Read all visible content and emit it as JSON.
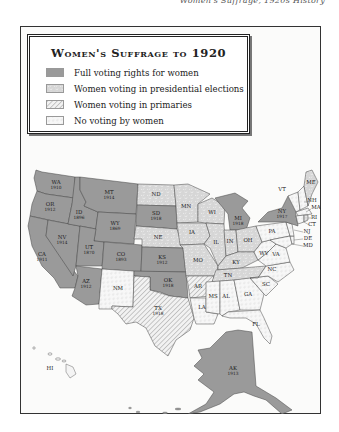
{
  "caption": "Women's Suffrage, 1920s History",
  "legend": {
    "title": "Women's Suffrage to 1920",
    "items": [
      {
        "key": "full",
        "label": "Full voting rights for women",
        "color": "#9a9a9a",
        "pattern": "solid"
      },
      {
        "key": "presidential",
        "label": "Women voting in presidential elections",
        "color": "#d4d4d4",
        "pattern": "speckle"
      },
      {
        "key": "primaries",
        "label": "Women voting in primaries",
        "color": "#e8e8e8",
        "pattern": "diagonal-lines"
      },
      {
        "key": "none",
        "label": "No voting by women",
        "color": "#f6f6f6",
        "pattern": "light-dashes"
      }
    ]
  },
  "states": [
    {
      "abbr": "WA",
      "year": "1910",
      "category": "full"
    },
    {
      "abbr": "OR",
      "year": "1912",
      "category": "full"
    },
    {
      "abbr": "CA",
      "year": "1911",
      "category": "full"
    },
    {
      "abbr": "ID",
      "year": "1896",
      "category": "full"
    },
    {
      "abbr": "NV",
      "year": "1914",
      "category": "full"
    },
    {
      "abbr": "MT",
      "year": "1914",
      "category": "full"
    },
    {
      "abbr": "WY",
      "year": "1869",
      "category": "full"
    },
    {
      "abbr": "UT",
      "year": "1870",
      "category": "full"
    },
    {
      "abbr": "CO",
      "year": "1893",
      "category": "full"
    },
    {
      "abbr": "AZ",
      "year": "1912",
      "category": "full"
    },
    {
      "abbr": "SD",
      "year": "1918",
      "category": "full"
    },
    {
      "abbr": "KS",
      "year": "1912",
      "category": "full"
    },
    {
      "abbr": "OK",
      "year": "1918",
      "category": "full"
    },
    {
      "abbr": "MI",
      "year": "1918",
      "category": "full"
    },
    {
      "abbr": "NY",
      "year": "1917",
      "category": "full"
    },
    {
      "abbr": "AK",
      "year": "1913",
      "category": "full"
    },
    {
      "abbr": "ND",
      "year": "",
      "category": "presidential"
    },
    {
      "abbr": "NE",
      "year": "",
      "category": "presidential"
    },
    {
      "abbr": "MN",
      "year": "",
      "category": "presidential"
    },
    {
      "abbr": "IA",
      "year": "",
      "category": "presidential"
    },
    {
      "abbr": "MO",
      "year": "",
      "category": "presidential"
    },
    {
      "abbr": "WI",
      "year": "",
      "category": "presidential"
    },
    {
      "abbr": "IL",
      "year": "",
      "category": "presidential"
    },
    {
      "abbr": "IN",
      "year": "",
      "category": "presidential"
    },
    {
      "abbr": "OH",
      "year": "",
      "category": "presidential"
    },
    {
      "abbr": "KY",
      "year": "",
      "category": "presidential"
    },
    {
      "abbr": "TN",
      "year": "",
      "category": "presidential"
    },
    {
      "abbr": "ME",
      "year": "",
      "category": "presidential"
    },
    {
      "abbr": "RI",
      "year": "",
      "category": "presidential"
    },
    {
      "abbr": "TX",
      "year": "1918",
      "category": "primaries"
    },
    {
      "abbr": "AR",
      "year": "",
      "category": "primaries"
    },
    {
      "abbr": "NM",
      "year": "",
      "category": "none"
    },
    {
      "abbr": "LA",
      "year": "",
      "category": "none"
    },
    {
      "abbr": "MS",
      "year": "",
      "category": "none"
    },
    {
      "abbr": "AL",
      "year": "",
      "category": "none"
    },
    {
      "abbr": "GA",
      "year": "",
      "category": "none"
    },
    {
      "abbr": "FL",
      "year": "",
      "category": "none"
    },
    {
      "abbr": "SC",
      "year": "",
      "category": "none"
    },
    {
      "abbr": "NC",
      "year": "",
      "category": "none"
    },
    {
      "abbr": "VA",
      "year": "",
      "category": "none"
    },
    {
      "abbr": "WV",
      "year": "",
      "category": "none"
    },
    {
      "abbr": "PA",
      "year": "",
      "category": "none"
    },
    {
      "abbr": "VT",
      "year": "",
      "category": "none"
    },
    {
      "abbr": "NH",
      "year": "",
      "category": "none"
    },
    {
      "abbr": "MA",
      "year": "",
      "category": "none"
    },
    {
      "abbr": "CT",
      "year": "",
      "category": "none"
    },
    {
      "abbr": "NJ",
      "year": "",
      "category": "none"
    },
    {
      "abbr": "DE",
      "year": "",
      "category": "none"
    },
    {
      "abbr": "MD",
      "year": "",
      "category": "none"
    },
    {
      "abbr": "HI",
      "year": "",
      "category": "none"
    }
  ],
  "labels": {
    "WA": "WA",
    "WA_y": "1910",
    "OR": "OR",
    "OR_y": "1912",
    "CA": "CA",
    "CA_y": "1911",
    "ID": "ID",
    "ID_y": "1896",
    "NV": "NV",
    "NV_y": "1914",
    "MT": "MT",
    "MT_y": "1914",
    "WY": "WY",
    "WY_y": "1869",
    "UT": "UT",
    "UT_y": "1870",
    "CO": "CO",
    "CO_y": "1893",
    "AZ": "AZ",
    "AZ_y": "1912",
    "SD": "SD",
    "SD_y": "1918",
    "KS": "KS",
    "KS_y": "1912",
    "OK": "OK",
    "OK_y": "1918",
    "MI": "MI",
    "MI_y": "1918",
    "NY": "NY",
    "NY_y": "1917",
    "AK": "AK",
    "AK_y": "1913",
    "TX": "TX",
    "TX_y": "1918",
    "ND": "ND",
    "NE": "NE",
    "MN": "MN",
    "IA": "IA",
    "MO": "MO",
    "WI": "WI",
    "IL": "IL",
    "IN": "IN",
    "OH": "OH",
    "KY": "KY",
    "TN": "TN",
    "ME": "ME",
    "RI": "RI",
    "AR": "AR",
    "NM": "NM",
    "LA": "LA",
    "MS": "MS",
    "AL": "AL",
    "GA": "GA",
    "FL": "FL",
    "SC": "SC",
    "NC": "NC",
    "VA": "VA",
    "WV": "WV",
    "PA": "PA",
    "VT": "VT",
    "NH": "NH",
    "MA": "MA",
    "CT": "CT",
    "NJ": "NJ",
    "DE": "DE",
    "MD": "MD",
    "HI": "HI"
  }
}
